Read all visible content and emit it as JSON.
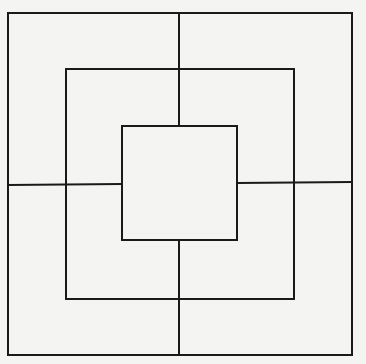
{
  "diagram": {
    "background": "#f4f4f2",
    "stroke_color": "#1a1a1a",
    "squares": [
      {
        "name": "outer",
        "x": 8,
        "y": 13,
        "w": 344,
        "h": 342
      },
      {
        "name": "middle",
        "x": 66,
        "y": 69,
        "w": 228,
        "h": 230
      },
      {
        "name": "inner",
        "x": 122,
        "y": 126,
        "w": 115,
        "h": 114
      }
    ],
    "cross_lines": [
      {
        "name": "top-vertical",
        "x1": 179,
        "y1": 13,
        "x2": 179,
        "y2": 126
      },
      {
        "name": "bottom-vertical",
        "x1": 179,
        "y1": 240,
        "x2": 179,
        "y2": 355
      },
      {
        "name": "left-horizontal",
        "x1": 8,
        "y1": 185,
        "x2": 122,
        "y2": 184
      },
      {
        "name": "right-horizontal",
        "x1": 237,
        "y1": 183,
        "x2": 352,
        "y2": 182
      }
    ]
  }
}
